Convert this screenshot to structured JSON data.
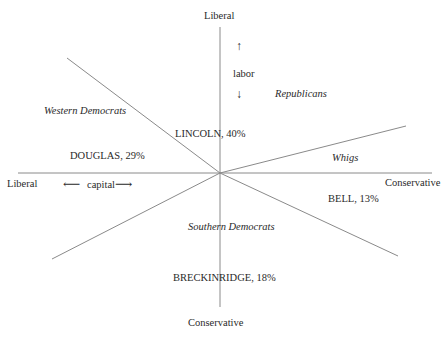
{
  "axes": {
    "vertical": {
      "top_label": "Liberal",
      "bottom_label": "Conservative",
      "dimension": "labor"
    },
    "horizontal": {
      "left_label": "Liberal",
      "right_label": "Conservative",
      "dimension": "capital"
    }
  },
  "regions": [
    {
      "name": "Western Democrats"
    },
    {
      "name": "Republicans"
    },
    {
      "name": "Whigs"
    },
    {
      "name": "Southern Democrats"
    }
  ],
  "candidates": [
    {
      "label": "LINCOLN, 40%",
      "name": "LINCOLN",
      "share": 40
    },
    {
      "label": "DOUGLAS, 29%",
      "name": "DOUGLAS",
      "share": 29
    },
    {
      "label": "BELL, 13%",
      "name": "BELL",
      "share": 13
    },
    {
      "label": "BRECKINRIDGE, 18%",
      "name": "BRECKINRIDGE",
      "share": 18
    }
  ],
  "colors": {
    "line": "#8a8a8a",
    "text": "#2a2a2a"
  }
}
